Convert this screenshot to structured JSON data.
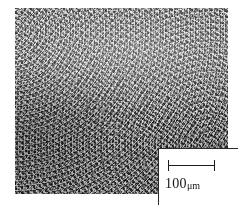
{
  "figure": {
    "type": "micrograph",
    "plate": {
      "x": 15,
      "y": 8,
      "width": 213,
      "height": 186,
      "matrix_color": "#6d6d6d",
      "particle_color": "#f2f2f2",
      "dark_color": "#2a2a2a"
    }
  },
  "scale_bar": {
    "value": "100",
    "unit": "μm",
    "label": "100μm",
    "bar_length_px": 47,
    "line_color": "#1d1d1d",
    "box_background": "#ffffff",
    "box_border_color": "#2b2b2b"
  }
}
